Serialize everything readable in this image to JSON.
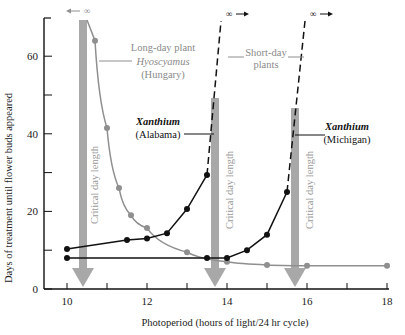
{
  "chart_data": {
    "type": "line",
    "title": "",
    "xlabel": "Photoperiod (hours of light/24 hr cycle)",
    "ylabel": "Days of treatment until flower buds appeared",
    "xlim": [
      9.4,
      18.1
    ],
    "ylim": [
      0,
      70
    ],
    "xticks": [
      10,
      11,
      12,
      13,
      14,
      15,
      16,
      17,
      18
    ],
    "xtick_labels": [
      "10",
      "12",
      "14",
      "16",
      "18"
    ],
    "yticks": [
      0,
      10,
      20,
      30,
      40,
      50,
      60
    ],
    "ytick_labels": [
      "0",
      "20",
      "40",
      "60"
    ],
    "grid": false,
    "series": [
      {
        "name": "Long-day plant Hyoscyamus (Hungary)",
        "color": "#8f8f8f",
        "x": [
          10.7,
          11.0,
          11.3,
          11.6,
          12.0,
          13.0,
          14.0,
          15.0,
          16.0,
          18.0
        ],
        "y": [
          64,
          41.5,
          26,
          19,
          15.7,
          9.5,
          7,
          6.2,
          6,
          6
        ],
        "infinite_at": 10.5
      },
      {
        "name": "Xanthium (Alabama)",
        "color": "#111111",
        "x": [
          10.0,
          11.5,
          12.0,
          12.5,
          13.0,
          13.5
        ],
        "y": [
          10.3,
          12.6,
          13,
          14.4,
          20.6,
          29.4
        ],
        "infinite_at": 13.8
      },
      {
        "name": "Xanthium (Michigan)",
        "color": "#111111",
        "x": [
          10.0,
          13.5,
          14.0,
          14.5,
          15.0,
          15.5
        ],
        "y": [
          8,
          8,
          8,
          10,
          14,
          25
        ],
        "infinite_at": 15.9
      }
    ],
    "critical_day_lengths": [
      10.4,
      13.7,
      15.7
    ],
    "annotations": [
      "Long-day plant",
      "Hyoscyamus",
      "(Hungary)",
      "Short-day",
      "plants",
      "Xanthium",
      "(Alabama)",
      "Xanthium",
      "(Michigan)",
      "Critical day length",
      "∞"
    ]
  },
  "labels": {
    "long_day_1": "Long-day plant",
    "long_day_2": "Hyoscyamus",
    "long_day_3": "(Hungary)",
    "short_day_1": "Short-day",
    "short_day_2": "plants",
    "alabama_1": "Xanthium",
    "alabama_2": "(Alabama)",
    "michigan_1": "Xanthium",
    "michigan_2": "(Michigan)",
    "critical": "Critical day length",
    "infinity": "∞",
    "xlabel": "Photoperiod (hours of light/24 hr cycle)",
    "ylabel": "Days of treatment until flower buds appeared"
  },
  "colors": {
    "grey_series": "#8f8f8f",
    "arrow": "#a8a8a8",
    "black": "#111111",
    "grey_text": "#8a8a8a"
  }
}
